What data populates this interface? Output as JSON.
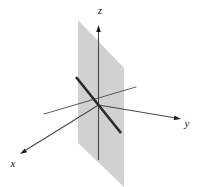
{
  "figure": {
    "background_color": "#ffffff",
    "width": 208,
    "height": 187,
    "origin": {
      "x": 98.5,
      "y": 105
    },
    "plane": {
      "name": "shaded-plane",
      "fill_color": "#c9c9c9",
      "opacity": 0.85,
      "points": "78,20 124,68 124,187 78,143",
      "description": "vertical shaded parallelogram plane"
    },
    "axes": [
      {
        "id": "z",
        "label": "z",
        "label_x": 100,
        "label_y": 14,
        "color": "#4a4a4a",
        "stroke_width": 1.1,
        "line": {
          "x1": 98.5,
          "y1": 160,
          "x2": 98.5,
          "y2": 28
        },
        "arrow": "up",
        "arrow_tip": {
          "x": 98.5,
          "y": 25
        }
      },
      {
        "id": "y",
        "label": "y",
        "label_x": 187,
        "label_y": 127,
        "color": "#4a4a4a",
        "stroke_width": 1.1,
        "line": {
          "x1": 98.5,
          "y1": 105,
          "x2": 176,
          "y2": 118
        },
        "arrow": "right-down",
        "arrow_tip": {
          "x": 181,
          "y": 119
        }
      },
      {
        "id": "x",
        "label": "x",
        "label_x": 13,
        "label_y": 167,
        "color": "#4a4a4a",
        "stroke_width": 1.1,
        "line": {
          "x1": 98.5,
          "y1": 105,
          "x2": 26,
          "y2": 150
        },
        "arrow": "left-down",
        "arrow_tip": {
          "x": 20,
          "y": 154
        }
      }
    ],
    "lines": [
      {
        "id": "thick-line",
        "name": "line-in-plane",
        "color": "#2b2b2b",
        "stroke_width": 2.6,
        "x1": 76,
        "y1": 77,
        "x2": 121,
        "y2": 133,
        "description": "bold line lying within the shaded plane"
      },
      {
        "id": "thin-guide-line",
        "name": "guide-line",
        "color": "#4a4a4a",
        "stroke_width": 0.9,
        "x1": 136,
        "y1": 87,
        "x2": 44,
        "y2": 114,
        "description": "thin auxiliary line through origin"
      }
    ],
    "arrowheads": {
      "color": "#1a1a1a",
      "length": 7,
      "width": 4.5
    }
  }
}
